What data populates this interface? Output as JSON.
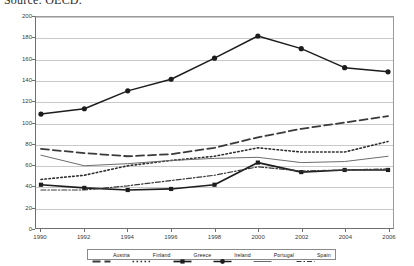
{
  "caption": {
    "source_text": "Source: OECD."
  },
  "chart_data": {
    "type": "line",
    "title": "",
    "xlabel": "",
    "ylabel": "",
    "x": [
      1990,
      1992,
      1994,
      1996,
      1998,
      2000,
      2002,
      2004,
      2006
    ],
    "categories": [
      "1990",
      "1992",
      "1994",
      "1996",
      "1998",
      "2000",
      "2002",
      "2004",
      "2006"
    ],
    "xlim": [
      1990,
      2006
    ],
    "ylim": [
      0,
      200
    ],
    "yticks": [
      0,
      20,
      40,
      60,
      80,
      100,
      120,
      140,
      160,
      180,
      200
    ],
    "ytick_labels": [
      "0",
      "20",
      "40",
      "60",
      "80",
      "100",
      "120",
      "140",
      "160",
      "180",
      "200"
    ],
    "grid": "horizontal",
    "legend_position": "bottom",
    "series": [
      {
        "name": "Austria",
        "values": [
          75,
          71,
          68,
          70,
          76,
          86,
          94,
          100,
          106
        ],
        "line_style": "long-dash",
        "color": "#3a3a3a",
        "width": 1.8,
        "marker": "none"
      },
      {
        "name": "Finland",
        "values": [
          46,
          50,
          59,
          64,
          68,
          76,
          72,
          72,
          82
        ],
        "line_style": "dotted",
        "color": "#2e2e2e",
        "width": 1.6,
        "marker": "none"
      },
      {
        "name": "Greece",
        "values": [
          41,
          38,
          36,
          37,
          41,
          62,
          53,
          55,
          55
        ],
        "line_style": "solid",
        "color": "#1c1c1c",
        "width": 1.7,
        "marker": "square"
      },
      {
        "name": "Ireland",
        "values": [
          108,
          113,
          130,
          141,
          161,
          182,
          170,
          152,
          148
        ],
        "line_style": "solid",
        "color": "#1c1c1c",
        "width": 1.5,
        "marker": "circle"
      },
      {
        "name": "Portugal",
        "values": [
          69,
          59,
          61,
          64,
          66,
          67,
          62,
          63,
          68
        ],
        "line_style": "solid",
        "color": "#6b6b6b",
        "width": 1.0,
        "marker": "none"
      },
      {
        "name": "Spain",
        "values": [
          36,
          36,
          40,
          45,
          50,
          58,
          54,
          55,
          56
        ],
        "line_style": "dash-dot",
        "color": "#3a3a3a",
        "width": 1.2,
        "marker": "none"
      }
    ]
  },
  "legend": {
    "entries": [
      {
        "label": "Austria"
      },
      {
        "label": "Finland"
      },
      {
        "label": "Greece"
      },
      {
        "label": "Ireland"
      },
      {
        "label": "Portugal"
      },
      {
        "label": "Spain"
      }
    ]
  }
}
